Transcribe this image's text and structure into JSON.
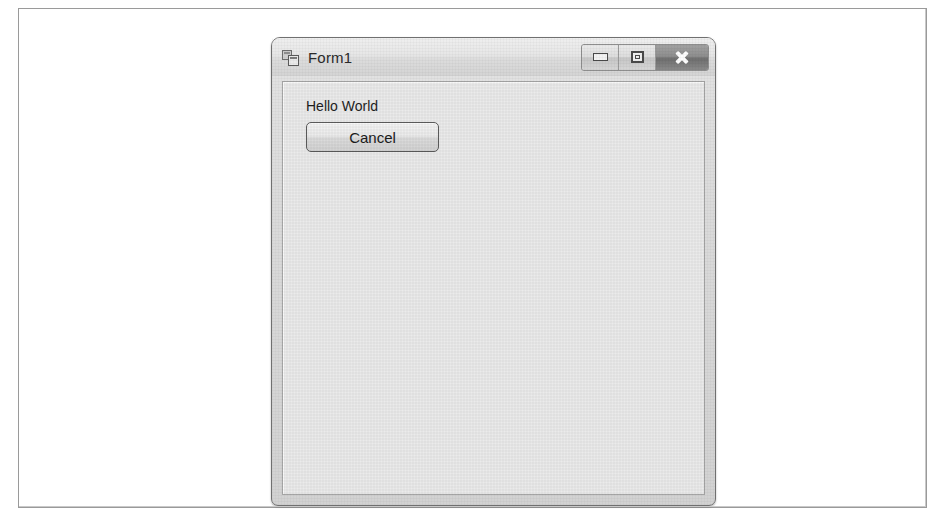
{
  "page": {
    "background_color": "#ffffff",
    "frame_border_color": "#9a9a9a"
  },
  "window": {
    "title": "Form1",
    "icon": "windows-form-designer-icon",
    "chrome_style": "windows-7-basic",
    "chrome_color": "#dadada",
    "client_background_color": "#ebebeb",
    "controls": [
      {
        "name": "minimize",
        "label": "Minimize",
        "glyph": "minimize-icon"
      },
      {
        "name": "maximize",
        "label": "Maximize",
        "glyph": "maximize-icon"
      },
      {
        "name": "close",
        "label": "Close",
        "glyph": "close-icon",
        "highlight_color": "#6f6f6f"
      }
    ]
  },
  "form": {
    "label": "Hello World",
    "button": {
      "text": "Cancel"
    }
  }
}
